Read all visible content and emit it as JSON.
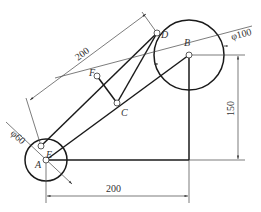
{
  "diagram": {
    "title": "",
    "points": {
      "A": {
        "label": "A",
        "x": 46,
        "y": 160
      },
      "B": {
        "label": "B",
        "x": 189,
        "y": 55
      },
      "C": {
        "label": "C",
        "x": 117,
        "y": 103
      },
      "D": {
        "label": "D",
        "x": 157,
        "y": 33
      },
      "E": {
        "label": "E",
        "x": 41,
        "y": 146
      },
      "F": {
        "label": "F",
        "x": 97,
        "y": 76
      }
    },
    "circles": [
      {
        "center": "A",
        "diameter_label": "φ60",
        "radius_px": 21
      },
      {
        "center": "B",
        "diameter_label": "φ100",
        "radius_px": 35
      }
    ],
    "dimensions": {
      "horizontal": "200",
      "vertical": "150",
      "diagonal": "200"
    },
    "colors": {
      "line": "#1a1a1a",
      "thin_line": "#444444",
      "background": "#ffffff"
    }
  }
}
